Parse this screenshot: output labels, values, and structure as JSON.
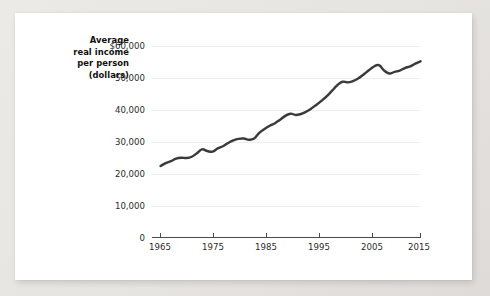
{
  "card": {
    "background_color": "#ffffff",
    "page_background_color": "#e8e6e3"
  },
  "chart_data": {
    "type": "line",
    "title": "",
    "subtitle": "",
    "xlabel": "",
    "ylabel_lines": [
      "Average",
      "real income",
      "per person",
      "(dollars)"
    ],
    "ylabel": "Average real income per person (dollars)",
    "line_color": "#3a3a3a",
    "grid": true,
    "grid_color": "#ededed",
    "legend": "none",
    "xlim": [
      1965,
      2015
    ],
    "ylim": [
      0,
      60000
    ],
    "ytick_labels": [
      "$60,000",
      "50,000",
      "40,000",
      "30,000",
      "20,000",
      "10,000",
      "0"
    ],
    "ytick_values": [
      60000,
      50000,
      40000,
      30000,
      20000,
      10000,
      0
    ],
    "xtick_labels": [
      "1965",
      "1975",
      "1985",
      "1995",
      "2005",
      "2015"
    ],
    "xtick_values": [
      1965,
      1975,
      1985,
      1995,
      2005,
      2015
    ],
    "series": [
      {
        "name": "Average real income per person",
        "x": [
          1965,
          1966,
          1967,
          1968,
          1969,
          1970,
          1971,
          1972,
          1973,
          1974,
          1975,
          1976,
          1977,
          1978,
          1979,
          1980,
          1981,
          1982,
          1983,
          1984,
          1985,
          1986,
          1987,
          1988,
          1989,
          1990,
          1991,
          1992,
          1993,
          1994,
          1995,
          1996,
          1997,
          1998,
          1999,
          2000,
          2001,
          2002,
          2003,
          2004,
          2005,
          2006,
          2007,
          2008,
          2009,
          2010,
          2011,
          2012,
          2013,
          2014,
          2015
        ],
        "values": [
          22400,
          23300,
          23900,
          24700,
          25000,
          24900,
          25300,
          26400,
          27600,
          27100,
          26900,
          27900,
          28600,
          29600,
          30400,
          30900,
          31000,
          30600,
          31000,
          32800,
          34000,
          35000,
          35800,
          36900,
          38100,
          38800,
          38400,
          38700,
          39400,
          40400,
          41600,
          42900,
          44300,
          46000,
          47700,
          48800,
          48600,
          49000,
          49800,
          51000,
          52300,
          53500,
          54000,
          52300,
          51400,
          51900,
          52300,
          53100,
          53600,
          54500,
          55200
        ]
      }
    ],
    "annotations": []
  }
}
